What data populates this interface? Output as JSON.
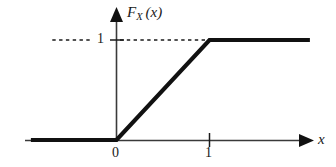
{
  "figure": {
    "title": "",
    "background_color": "#ffffff",
    "ink_color": "#1a1a1a",
    "axis_color": "#3a3a3a"
  },
  "labels": {
    "y_axis_function": {
      "base": "F",
      "subscript": "X",
      "argument": "(x)",
      "full": "F_X (x)"
    },
    "y_tick_one": "1",
    "x_tick_zero": "0",
    "x_tick_one": "1",
    "x_axis_name": "x"
  },
  "chart_data": {
    "type": "line",
    "title": "",
    "subtitle": "",
    "xlabel": "x",
    "ylabel": "F_X (x)",
    "xlim": [
      -1.0,
      2.0
    ],
    "ylim": [
      0,
      1.25
    ],
    "xticks": [
      0,
      1
    ],
    "xticklabels": [
      "0",
      "1"
    ],
    "yticks": [
      1
    ],
    "yticklabels": [
      "1"
    ],
    "grid": false,
    "legend": null,
    "series": [
      {
        "name": "F_X (x)",
        "description": "Cumulative distribution function of a continuous uniform random variable on [0, 1]",
        "linewidth": "thick",
        "color": "#111111",
        "x": [
          -0.92,
          0.0,
          1.0,
          2.08
        ],
        "values": [
          0,
          0,
          1,
          1
        ]
      }
    ],
    "annotations": [
      {
        "name": "level-one-guide",
        "type": "dashed-horizontal-line",
        "y": 1,
        "x_from": -0.69,
        "x_to": 1.0,
        "note": "dashed guide line at F_X(x) = 1, interrupted by the y-axis tick label"
      }
    ]
  }
}
